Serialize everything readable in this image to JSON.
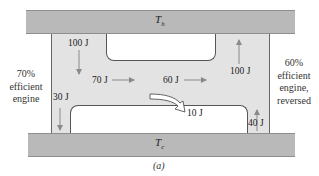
{
  "reservoirs": {
    "hot": {
      "symbol": "T",
      "subscript": "h"
    },
    "cold": {
      "symbol": "T",
      "subscript": "c"
    }
  },
  "engines": {
    "left": {
      "efficiency": "70%",
      "line2": "efficient",
      "line3": "engine"
    },
    "right": {
      "efficiency": "60%",
      "line2": "efficient",
      "line3": "engine,",
      "line4": "reversed"
    }
  },
  "energy_flows": {
    "hot_to_left": "100 J",
    "left_work": "70 J",
    "net_work": "60 J",
    "right_to_hot": "100 J",
    "left_to_cold": "30 J",
    "cold_to_right": "40 J",
    "leftover_work": "10 J"
  },
  "caption": "(a)",
  "colors": {
    "reservoir": "#b9b9b9",
    "engine_body": "#e3e3e3",
    "arrow": "#8a8a8a",
    "outline": "#555555"
  }
}
